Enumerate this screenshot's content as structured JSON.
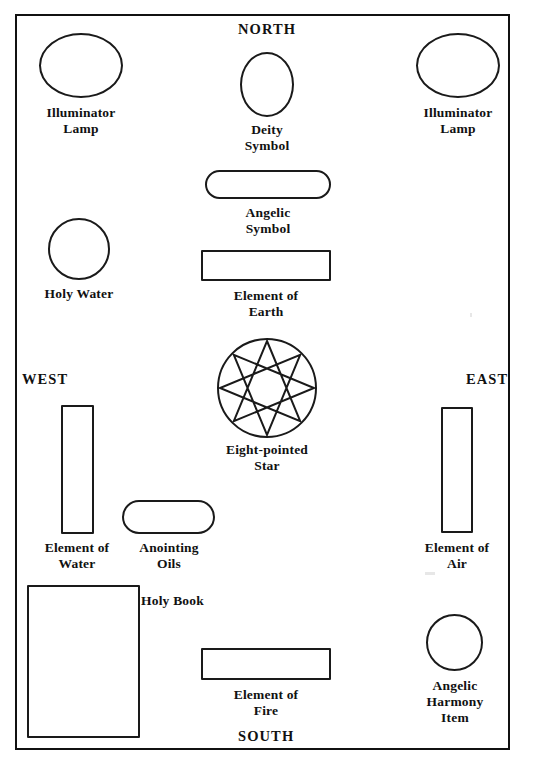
{
  "diagram": {
    "compass": {
      "north": "NORTH",
      "south": "SOUTH",
      "east": "EAST",
      "west": "WEST"
    },
    "items": [
      {
        "id": "illuminator-lamp-left",
        "label": "Illuminator\nLamp",
        "shape": "ellipse"
      },
      {
        "id": "deity-symbol",
        "label": "Deity\nSymbol",
        "shape": "ellipse"
      },
      {
        "id": "illuminator-lamp-right",
        "label": "Illuminator\nLamp",
        "shape": "ellipse"
      },
      {
        "id": "angelic-symbol",
        "label": "Angelic\nSymbol",
        "shape": "pill"
      },
      {
        "id": "holy-water",
        "label": "Holy Water",
        "shape": "circle"
      },
      {
        "id": "element-of-earth",
        "label": "Element of\nEarth",
        "shape": "rect"
      },
      {
        "id": "eight-pointed-star",
        "label": "Eight-pointed\nStar",
        "shape": "star-in-circle"
      },
      {
        "id": "element-of-water",
        "label": "Element of\nWater",
        "shape": "rect"
      },
      {
        "id": "anointing-oils",
        "label": "Anointing\nOils",
        "shape": "pill"
      },
      {
        "id": "element-of-air",
        "label": "Element of\nAir",
        "shape": "rect"
      },
      {
        "id": "holy-book",
        "label": "Holy Book",
        "shape": "rect"
      },
      {
        "id": "element-of-fire",
        "label": "Element of\nFire",
        "shape": "rect"
      },
      {
        "id": "angelic-harmony-item",
        "label": "Angelic\nHarmony\nItem",
        "shape": "circle"
      }
    ],
    "colors": {
      "ink": "#111111",
      "stroke": "#1a1a1a",
      "paper": "#ffffff"
    },
    "star": {
      "points": 8,
      "step": 3,
      "description": "octagram star polygon inscribed in circle"
    }
  }
}
